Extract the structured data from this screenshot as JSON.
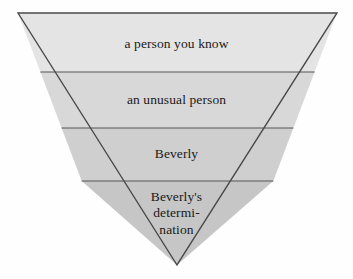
{
  "diagram": {
    "type": "inverted-pyramid",
    "title": "",
    "background_color": "#fefefe",
    "outline_color": "#4a4a4a",
    "text_color": "#191919",
    "geometry": {
      "top_left_x": 18,
      "top_right_x": 337,
      "top_y": 13,
      "apex_x": 177,
      "apex_y": 265,
      "divider_y": [
        72,
        128,
        181
      ]
    },
    "tiers": [
      {
        "id": "tier-1",
        "label": "a person you know",
        "fill": "#e4e4e4",
        "order": 1
      },
      {
        "id": "tier-2",
        "label": "an unusual person",
        "fill": "#d8d8d8",
        "order": 2
      },
      {
        "id": "tier-3",
        "label": "Beverly",
        "fill": "#cfcfcf",
        "order": 3
      },
      {
        "id": "tier-4",
        "label": "Beverly's\ndetermi-\nnation",
        "fill": "#c6c6c6",
        "order": 4
      }
    ]
  }
}
